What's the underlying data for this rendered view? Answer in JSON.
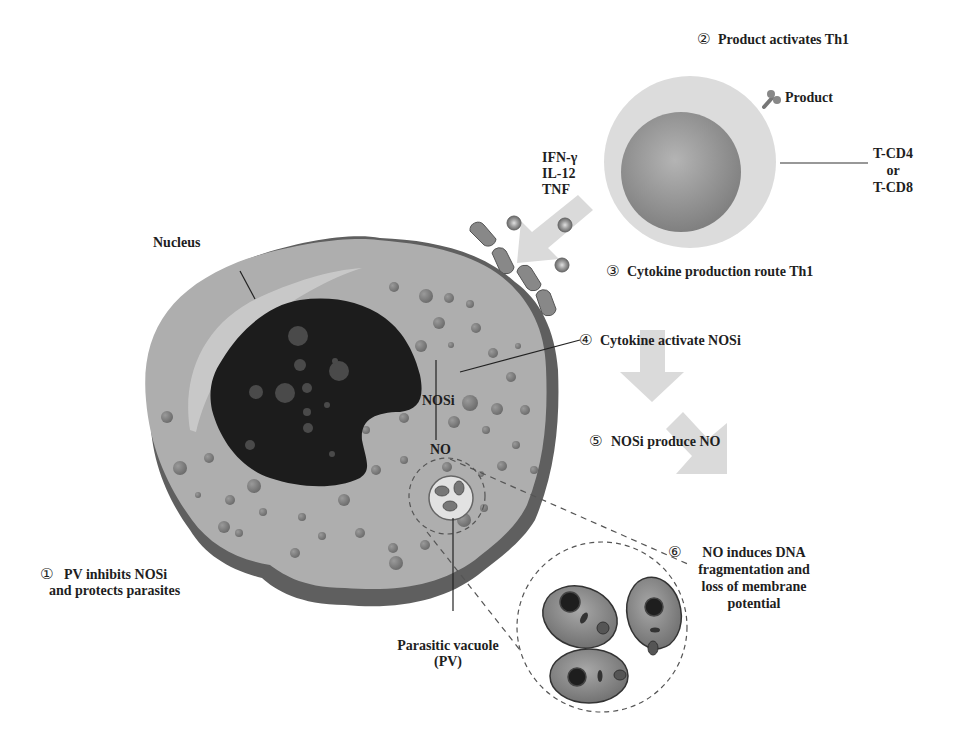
{
  "diagram": {
    "type": "biological-mechanism",
    "colors": {
      "background": "#ffffff",
      "cytoplasm": "#aeaeae",
      "membrane": "#5f5f5f",
      "nucleus": "#1c1c1c",
      "granule": "#7a7a7a",
      "arrow": "#dadada",
      "tcell_outer": "#dcdcdc",
      "tcell_inner": "#8e8e8e",
      "text": "#1e1e1e"
    },
    "steps": [
      {
        "num": "①",
        "lines": [
          "PV inhibits NOSi",
          "and protects parasites"
        ]
      },
      {
        "num": "②",
        "lines": [
          "Product activates Th1"
        ]
      },
      {
        "num": "③",
        "lines": [
          "Cytokine production route Th1"
        ]
      },
      {
        "num": "④",
        "lines": [
          "Cytokine activate NOSi"
        ]
      },
      {
        "num": "⑤",
        "lines": [
          "NOSi produce NO"
        ]
      },
      {
        "num": "⑥",
        "lines": [
          "NO induces DNA",
          "fragmentation and",
          "loss of membrane",
          "potential"
        ]
      }
    ],
    "labels": {
      "product": "Product",
      "tcell": [
        "T-CD4",
        "or",
        "T-CD8"
      ],
      "cytokines": [
        "IFN-γ",
        "IL-12",
        "TNF"
      ],
      "nucleus": "Nucleus",
      "nosi": "NOSi",
      "no": "NO",
      "pv": [
        "Parasitic vacuole",
        "(PV)"
      ]
    }
  }
}
